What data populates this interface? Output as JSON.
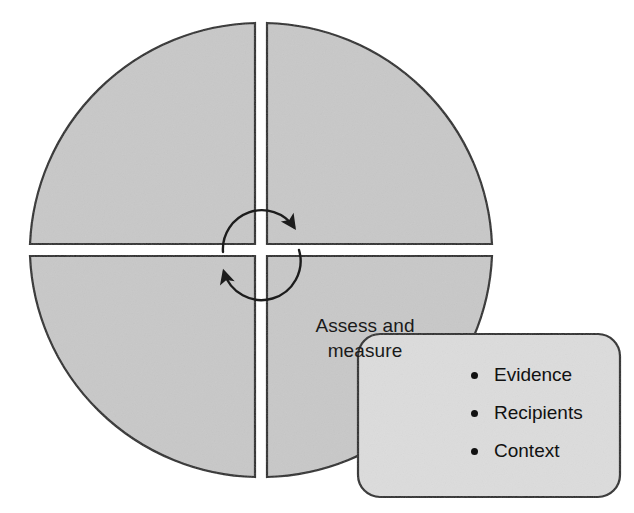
{
  "figure": {
    "type": "cycle-quadrant-diagram",
    "colors": {
      "quadrant_fill": "#c8c8c8",
      "quadrant_stroke": "#2b2b2b",
      "callout_fill": "#dcdcdc",
      "callout_stroke": "#2b2b2b",
      "text": "#111111",
      "page_background": "#ffffff"
    },
    "circle": {
      "center_x": 261,
      "center_y": 250,
      "radius": 231,
      "gap_px": 12
    },
    "quadrants": [
      {
        "id": "top-left",
        "label": ""
      },
      {
        "id": "top-right",
        "label": ""
      },
      {
        "id": "bottom-left",
        "label": ""
      },
      {
        "id": "bottom-right",
        "label": "Assess and\nmeasure"
      }
    ],
    "arrows": [
      {
        "id": "arrow-top",
        "direction": "clockwise",
        "head": "lower-right"
      },
      {
        "id": "arrow-bottom",
        "direction": "clockwise",
        "head": "upper-left"
      }
    ]
  },
  "labels": {
    "assess_and_measure": "Assess and\nmeasure"
  },
  "callout": {
    "title": "",
    "items": [
      {
        "label": "Evidence"
      },
      {
        "label": "Recipients"
      },
      {
        "label": "Context"
      }
    ]
  }
}
